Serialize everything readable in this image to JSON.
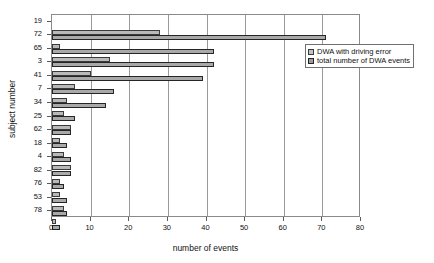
{
  "chart_data": {
    "type": "bar",
    "orientation": "horizontal",
    "title": "",
    "xlabel": "number of events",
    "ylabel": "subject number",
    "xlim": [
      0,
      80
    ],
    "xticks": [
      0,
      10,
      20,
      30,
      40,
      50,
      60,
      70,
      80
    ],
    "grid": "vertical",
    "legend_position": "upper right inside",
    "categories": [
      "19",
      "72",
      "65",
      "3",
      "41",
      "7",
      "34",
      "25",
      "62",
      "18",
      "4",
      "82",
      "76",
      "53",
      "78"
    ],
    "series": [
      {
        "name": "DWA with driving error",
        "color": "#b9b9b9",
        "values": [
          28,
          2,
          15,
          10,
          6,
          4,
          3,
          5,
          2,
          3,
          5,
          2,
          2,
          3,
          1
        ]
      },
      {
        "name": "total number of DWA events",
        "color": "#a9a9a9",
        "values": [
          71,
          42,
          42,
          39,
          16,
          14,
          6,
          5,
          4,
          5,
          5,
          3,
          4,
          4,
          2
        ]
      }
    ]
  },
  "legend": {
    "entries": [
      {
        "label": "DWA with driving error"
      },
      {
        "label": "total number of DWA events"
      }
    ]
  },
  "axes": {
    "x_title": "number of events",
    "y_title": "subject number",
    "x_tick_labels": [
      "0",
      "10",
      "20",
      "30",
      "40",
      "50",
      "60",
      "70",
      "80"
    ],
    "y_tick_labels": [
      "19",
      "72",
      "65",
      "3",
      "41",
      "7",
      "34",
      "25",
      "62",
      "18",
      "4",
      "82",
      "76",
      "53",
      "78"
    ]
  }
}
